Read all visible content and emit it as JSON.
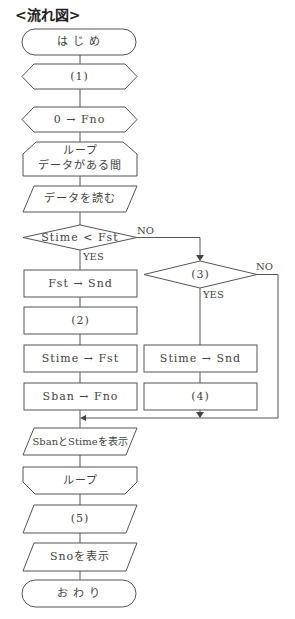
{
  "title": "<流れ図>",
  "nodes": {
    "start": "は じ め",
    "step1": "(1)",
    "init": "0 → Fno",
    "loop_start_line1": "ループ",
    "loop_start_line2": "データがある間",
    "read": "データを読む",
    "cond1": "Stime < Fst",
    "fst_snd": "Fst → Snd",
    "step2": "(2)",
    "stime_fst": "Stime → Fst",
    "sban_fno": "Sban → Fno",
    "cond3": "(3)",
    "stime_snd": "Stime → Snd",
    "step4": "(4)",
    "display1": "SbanとStimeを表示",
    "loop_end": "ループ",
    "step5": "(5)",
    "display2": "Snoを表示",
    "end": "お わ り"
  },
  "branch_labels": {
    "cond1_no": "NO",
    "cond1_yes": "YES",
    "cond3_no": "NO",
    "cond3_yes": "YES"
  },
  "colors": {
    "line": "#555555",
    "background": "#ffffff"
  }
}
